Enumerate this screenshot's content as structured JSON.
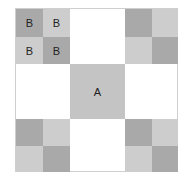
{
  "diagram": {
    "center_label": "A",
    "corner_labels": [
      "B",
      "B",
      "B",
      "B"
    ],
    "colors": {
      "dark": "#a9a9a9",
      "light": "#cdcdcd",
      "center": "#c4c4c4",
      "border": "#cfcfcf"
    }
  }
}
